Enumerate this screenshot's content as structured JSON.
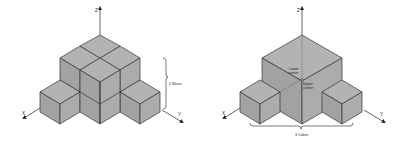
{
  "figures": [
    {
      "name": "pyramid-of-cubes",
      "axes": {
        "x": "X",
        "y": "Y",
        "z": "Z"
      },
      "annotation": "2 Slices"
    },
    {
      "name": "bounding-cube",
      "axes": {
        "x": "X",
        "y": "Y",
        "z": "Z"
      },
      "corner_labels": {
        "lower": [
          "Lower",
          "corner"
        ],
        "upper": [
          "Upper",
          "corner"
        ]
      },
      "annotation": "3 Cubes"
    }
  ],
  "colors": {
    "top": "#b3b3b3",
    "left": "#a2a2a2",
    "right": "#acacac",
    "line": "#333333"
  }
}
